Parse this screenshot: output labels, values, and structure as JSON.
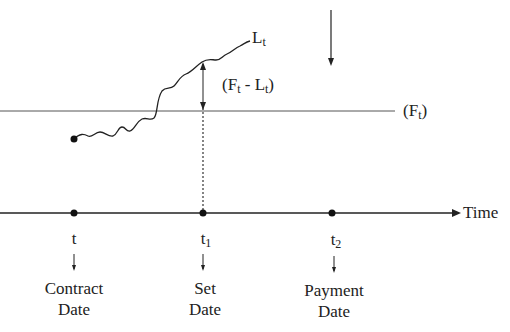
{
  "diagram": {
    "forward_rate_label": "(F",
    "forward_rate_sub": "t",
    "forward_rate_close": ")",
    "libor_label": "L",
    "libor_sub": "t",
    "spread_label_open": "(F",
    "spread_sub1": "t",
    "spread_mid": " - L",
    "spread_sub2": "t",
    "spread_close": ")",
    "axis_label": "Time",
    "points": [
      {
        "symbol": "t",
        "sub": "",
        "line1": "Contract",
        "line2": "Date"
      },
      {
        "symbol": "t",
        "sub": "1",
        "line1": "Set",
        "line2": "Date"
      },
      {
        "symbol": "t",
        "sub": "2",
        "line1": "Payment",
        "line2": "Date"
      }
    ]
  }
}
